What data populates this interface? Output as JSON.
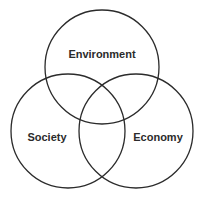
{
  "diagram": {
    "type": "venn-3",
    "sets": [
      {
        "id": "environment",
        "label": "Environment"
      },
      {
        "id": "society",
        "label": "Society"
      },
      {
        "id": "economy",
        "label": "Economy"
      }
    ],
    "stroke_color": "#2b2b2b",
    "text_color": "#2b2b2b",
    "background": "#ffffff"
  }
}
